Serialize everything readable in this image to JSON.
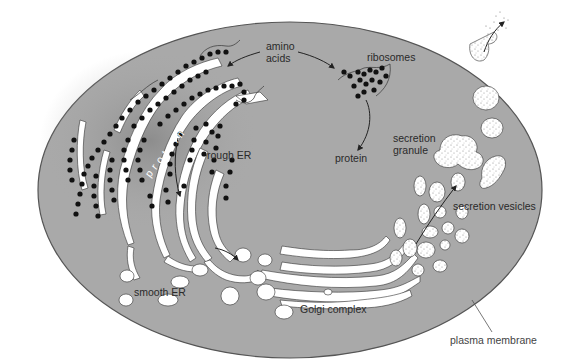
{
  "diagram": {
    "colors": {
      "background": "#ffffff",
      "cytoplasm": "#a9a9a9",
      "membrane_outline": "#555555",
      "organelle_fill": "#ffffff",
      "ribosome": "#111111",
      "label_text": "#2a2a2a"
    },
    "labels": {
      "amino_acids_line1": "amino",
      "amino_acids_line2": "acids",
      "ribosomes": "ribosomes",
      "protein_free": "protein",
      "protein_in_er": "protein",
      "rough_er": "rough ER",
      "smooth_er": "smooth ER",
      "golgi_complex": "Golgi complex",
      "secretion_granule_line1": "secretion",
      "secretion_granule_line2": "granule",
      "secretion_vesicles": "secretion vesicles",
      "plasma_membrane": "plasma membrane"
    },
    "flow": [
      "amino acids",
      "ribosomes",
      "protein",
      "rough ER",
      "smooth ER",
      "Golgi complex",
      "secretion vesicles",
      "secretion granule",
      "exocytosis through plasma membrane"
    ]
  }
}
